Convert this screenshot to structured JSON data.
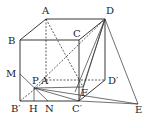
{
  "figure": {
    "type": "cube-geometry",
    "labels": {
      "A": "A",
      "B": "B",
      "C": "C",
      "D": "D",
      "A1": "A′",
      "B1": "B′",
      "C1": "C′",
      "D1": "D′",
      "M": "M",
      "P": "P",
      "H": "H",
      "N": "N",
      "F": "F",
      "E": "E"
    }
  }
}
